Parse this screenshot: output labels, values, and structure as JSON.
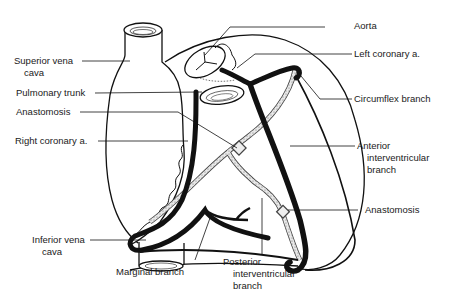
{
  "figure": {
    "labels": {
      "superior_vena_cava": [
        "Superior vena",
        "cava"
      ],
      "pulmonary_trunk": "Pulmonary trunk",
      "anastomosis_left": "Anastomosis",
      "right_coronary": "Right coronary a.",
      "inferior_vena_cava": [
        "Inferior vena",
        "cava"
      ],
      "marginal_branch": "Marginal branch",
      "posterior_interventricular": [
        "Posterior",
        "interventricular",
        "branch"
      ],
      "aorta": "Aorta",
      "left_coronary": "Left coronary a.",
      "circumflex_branch": "Circumflex branch",
      "anterior_interventricular": [
        "Anterior",
        "interventricular",
        "branch"
      ],
      "anastomosis_right": "Anastomosis"
    }
  }
}
